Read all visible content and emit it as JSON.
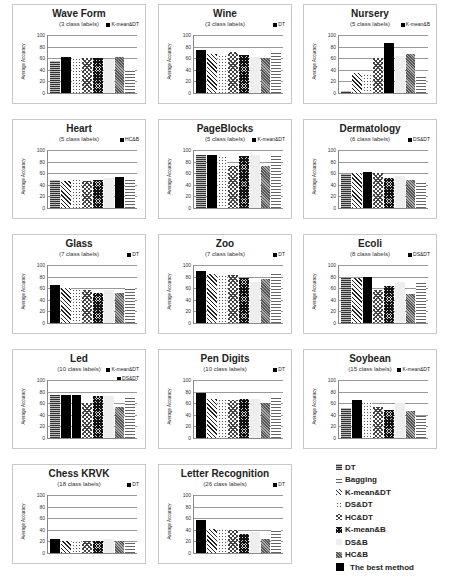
{
  "chart_data": [
    {
      "type": "bar",
      "title": "Wave Form",
      "subtitle": "(3 class labels)",
      "ylabel": "Average Accuracy",
      "ylim": [
        0,
        100
      ],
      "yticks": [
        0,
        20,
        40,
        60,
        80,
        100
      ],
      "best": "K-mean&DT",
      "categories": [
        "DT",
        "K-mean&DT",
        "DS&DT",
        "HC&DT",
        "K-mean&B",
        "DS&B",
        "HC&B",
        "Bagging"
      ],
      "values": [
        55,
        62,
        60,
        60,
        60,
        58,
        62,
        42
      ]
    },
    {
      "type": "bar",
      "title": "Wine",
      "subtitle": "(3 class labels)",
      "ylabel": "Average Accuracy",
      "ylim": [
        0,
        100
      ],
      "yticks": [
        0,
        20,
        40,
        60,
        80,
        100
      ],
      "best": "DT",
      "categories": [
        "DT",
        "K-mean&DT",
        "DS&DT",
        "HC&DT",
        "K-mean&B",
        "DS&B",
        "HC&B",
        "Bagging"
      ],
      "values": [
        75,
        68,
        65,
        70,
        65,
        62,
        60,
        70
      ]
    },
    {
      "type": "bar",
      "title": "Nursery",
      "subtitle": "(5 class labels)",
      "ylabel": "Average Accuracy",
      "ylim": [
        0,
        100
      ],
      "yticks": [
        0,
        20,
        40,
        60,
        80,
        100
      ],
      "best": "K-mean&B",
      "categories": [
        "DT",
        "K-mean&DT",
        "DS&DT",
        "HC&DT",
        "K-mean&B",
        "DS&B",
        "HC&B",
        "Bagging"
      ],
      "values": [
        3,
        35,
        32,
        60,
        86,
        64,
        67,
        30
      ]
    },
    {
      "type": "bar",
      "title": "Heart",
      "subtitle": "(5 class labels)",
      "ylabel": "Average Accuracy",
      "ylim": [
        0,
        100
      ],
      "yticks": [
        0,
        20,
        40,
        60,
        80,
        100
      ],
      "best": "HC&B",
      "categories": [
        "DT",
        "K-mean&DT",
        "DS&DT",
        "HC&DT",
        "K-mean&B",
        "DS&B",
        "HC&B",
        "Bagging"
      ],
      "values": [
        48,
        47,
        50,
        47,
        49,
        51,
        54,
        50
      ]
    },
    {
      "type": "bar",
      "title": "PageBlocks",
      "subtitle": "(5 class labels)",
      "ylabel": "Average Accuracy",
      "ylim": [
        0,
        100
      ],
      "yticks": [
        0,
        20,
        40,
        60,
        80,
        100
      ],
      "best": "K-mean&DT",
      "categories": [
        "DT",
        "K-mean&DT",
        "DS&DT",
        "HC&DT",
        "K-mean&B",
        "DS&B",
        "HC&B",
        "Bagging"
      ],
      "values": [
        92,
        92,
        90,
        72,
        89,
        91,
        72,
        92
      ]
    },
    {
      "type": "bar",
      "title": "Dermatology",
      "subtitle": "(6 class labels)",
      "ylabel": "Average Accuracy",
      "ylim": [
        0,
        100
      ],
      "yticks": [
        0,
        20,
        40,
        60,
        80,
        100
      ],
      "best": "DS&DT",
      "categories": [
        "DT",
        "K-mean&DT",
        "DS&DT",
        "HC&DT",
        "K-mean&B",
        "DS&B",
        "HC&B",
        "Bagging"
      ],
      "values": [
        58,
        60,
        62,
        60,
        52,
        55,
        48,
        43
      ]
    },
    {
      "type": "bar",
      "title": "Glass",
      "subtitle": "(7 class labels)",
      "ylabel": "Average Accuracy",
      "ylim": [
        0,
        100
      ],
      "yticks": [
        0,
        20,
        40,
        60,
        80,
        100
      ],
      "best": "DT",
      "categories": [
        "DT",
        "K-mean&DT",
        "DS&DT",
        "HC&DT",
        "K-mean&B",
        "DS&B",
        "HC&B",
        "Bagging"
      ],
      "values": [
        65,
        61,
        58,
        57,
        52,
        57,
        52,
        60
      ]
    },
    {
      "type": "bar",
      "title": "Zoo",
      "subtitle": "(7 class labels)",
      "ylabel": "Average Accuracy",
      "ylim": [
        0,
        100
      ],
      "yticks": [
        0,
        20,
        40,
        60,
        80,
        100
      ],
      "best": "DT",
      "categories": [
        "DT",
        "K-mean&DT",
        "DS&DT",
        "HC&DT",
        "K-mean&B",
        "DS&B",
        "HC&B",
        "Bagging"
      ],
      "values": [
        90,
        85,
        83,
        82,
        77,
        71,
        76,
        87
      ]
    },
    {
      "type": "bar",
      "title": "Ecoli",
      "subtitle": "(8 class labels)",
      "ylabel": "Average Accuracy",
      "ylim": [
        0,
        100
      ],
      "yticks": [
        0,
        20,
        40,
        60,
        80,
        100
      ],
      "best": "DS&DT",
      "categories": [
        "DT",
        "K-mean&DT",
        "DS&DT",
        "HC&DT",
        "K-mean&B",
        "DS&B",
        "HC&B",
        "Bagging"
      ],
      "values": [
        78,
        78,
        79,
        57,
        64,
        71,
        50,
        73
      ]
    },
    {
      "type": "bar",
      "title": "Led",
      "subtitle": "(10 class labels)",
      "ylabel": "Average Accuracy",
      "ylim": [
        0,
        100
      ],
      "yticks": [
        0,
        20,
        40,
        60,
        80,
        100
      ],
      "best": "K-mean&DT, DS&DT",
      "categories": [
        "DT",
        "K-mean&DT",
        "DS&DT",
        "HC&DT",
        "K-mean&B",
        "DS&B",
        "HC&B",
        "Bagging"
      ],
      "values": [
        75,
        75,
        75,
        61,
        72,
        73,
        53,
        73
      ]
    },
    {
      "type": "bar",
      "title": "Pen Digits",
      "subtitle": "(10 class labels)",
      "ylabel": "Average Accuracy",
      "ylim": [
        0,
        100
      ],
      "yticks": [
        0,
        20,
        40,
        60,
        80,
        100
      ],
      "best": "DT",
      "categories": [
        "DT",
        "K-mean&DT",
        "DS&DT",
        "HC&DT",
        "K-mean&B",
        "DS&B",
        "HC&B",
        "Bagging"
      ],
      "values": [
        78,
        68,
        67,
        66,
        68,
        67,
        61,
        73
      ]
    },
    {
      "type": "bar",
      "title": "Soybean",
      "subtitle": "(15 class labels)",
      "ylabel": "Average Accuracy",
      "ylim": [
        0,
        100
      ],
      "yticks": [
        0,
        20,
        40,
        60,
        80,
        100
      ],
      "best": "K-mean&DT",
      "categories": [
        "DT",
        "K-mean&DT",
        "DS&DT",
        "HC&DT",
        "K-mean&B",
        "DS&B",
        "HC&B",
        "Bagging"
      ],
      "values": [
        52,
        65,
        62,
        53,
        49,
        60,
        47,
        38
      ]
    },
    {
      "type": "bar",
      "title": "Chess KRVK",
      "subtitle": "(18 class labels)",
      "ylabel": "Average Accuracy",
      "ylim": [
        0,
        100
      ],
      "yticks": [
        0,
        20,
        40,
        60,
        80,
        100
      ],
      "best": "DT",
      "categories": [
        "DT",
        "K-mean&DT",
        "DS&DT",
        "HC&DT",
        "K-mean&B",
        "DS&B",
        "HC&B",
        "Bagging"
      ],
      "values": [
        25,
        20,
        21,
        20,
        21,
        25,
        21,
        17
      ]
    },
    {
      "type": "bar",
      "title": "Letter Recognition",
      "subtitle": "(26 class labels)",
      "ylabel": "Average Accuracy",
      "ylim": [
        0,
        100
      ],
      "yticks": [
        0,
        20,
        40,
        60,
        80,
        100
      ],
      "best": "DT",
      "categories": [
        "DT",
        "K-mean&DT",
        "DS&DT",
        "HC&DT",
        "K-mean&B",
        "DS&B",
        "HC&B",
        "Bagging"
      ],
      "values": [
        57,
        42,
        42,
        40,
        32,
        36,
        24,
        39
      ]
    }
  ],
  "legend": [
    {
      "label": "DT",
      "pattern": "p-dt"
    },
    {
      "label": "Bagging",
      "pattern": "p-bag"
    },
    {
      "label": "K-mean&DT",
      "pattern": "p-kdt"
    },
    {
      "label": "DS&DT",
      "pattern": "p-dsdt"
    },
    {
      "label": "HC&DT",
      "pattern": "p-hcdt"
    },
    {
      "label": "K-mean&B",
      "pattern": "p-kb"
    },
    {
      "label": "DS&B",
      "pattern": "p-dsb"
    },
    {
      "label": "HC&B",
      "pattern": "p-hcb"
    },
    {
      "label": "The best method",
      "pattern": "p-best"
    }
  ]
}
